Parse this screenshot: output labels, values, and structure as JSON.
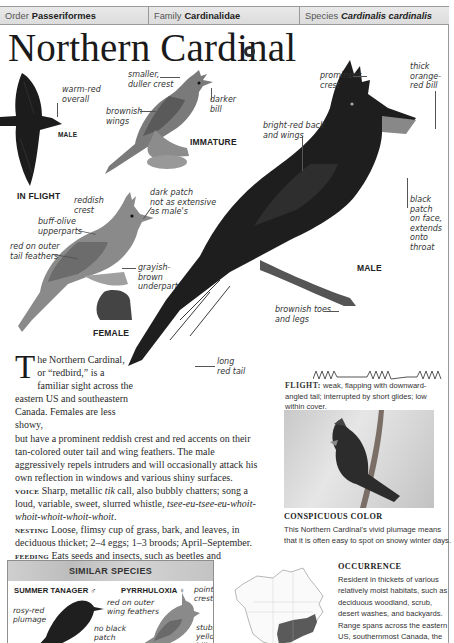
{
  "header": {
    "order": {
      "label": "Order",
      "value": "Passeriformes"
    },
    "family": {
      "label": "Family",
      "value": "Cardinalidae"
    },
    "species": {
      "label": "Species",
      "value": "Cardinalis cardinalis"
    }
  },
  "title": "Northern Cardinal",
  "icons": {
    "sound": "sound-icon"
  },
  "illustrations": {
    "in_flight": {
      "caption": "IN FLIGHT",
      "sex_label": "MALE",
      "annotations": [
        "warm-red\noverall"
      ]
    },
    "immature": {
      "caption": "IMMATURE",
      "annotations": [
        "smaller,\nduller crest",
        "darker\nbill",
        "brownish\nwings"
      ]
    },
    "female": {
      "caption": "FEMALE",
      "annotations": [
        "reddish\ncrest",
        "dark patch\nnot as extensive\nas male's",
        "buff-olive\nupperparts",
        "red on outer\ntail feathers",
        "grayish-\nbrown\nunderparts"
      ]
    },
    "male": {
      "caption": "MALE",
      "annotations": [
        "prominent\ncrest",
        "thick\norange-\nred bill",
        "bright-red back\nand wings",
        "black\npatch\non face,\nextends\nonto\nthroat",
        "brownish toes\nand legs",
        "long\nred tail"
      ]
    }
  },
  "description": {
    "dropcap": "T",
    "intro_narrow": [
      "he Northern Cardinal,",
      "or “redbird,” is a",
      "familiar sight across the",
      "eastern US and southeastern",
      "Canada. Females are less showy,"
    ],
    "intro_rest": "but have a prominent reddish crest and red accents on their tan-colored outer tail and wing feathers. The male aggressively repels intruders and will occasionally attack his own reflection in windows and various shiny surfaces.",
    "voice": {
      "label": "VOICE",
      "text_1": "Sharp, metallic ",
      "call": "tik",
      "text_2": " call, also bubbly chatters; song a loud, variable, sweet, slurred whistle, ",
      "song": "tsee-eu-tsee-eu-whoit-whoit-whoit-whoit-whoit",
      "text_3": "."
    },
    "nesting": {
      "label": "NESTING",
      "text": "Loose, flimsy cup of grass, bark, and leaves, in deciduous thicket; 2–4 eggs; 1–3 broods; April–September."
    },
    "feeding": {
      "label": "FEEDING",
      "text": "Eats seeds and insects, such as beetles and caterpillars; also buds and fruit."
    }
  },
  "flight": {
    "label": "FLIGHT:",
    "text": "weak, flapping with downward-angled tail; interrupted by short glides; low within cover."
  },
  "photo": {
    "title": "CONSPICUOUS COLOR",
    "caption": "This Northern Cardinal’s vivid plumage means that it is often easy to spot on snowy winter days."
  },
  "similar_species": {
    "title": "SIMILAR SPECIES",
    "species": [
      {
        "name": "SUMMER TANAGER ♂",
        "annotations": [
          "rosy-red\nplumage",
          "no black\npatch"
        ]
      },
      {
        "name": "PYRRHULOXIA ♀",
        "annotations": [
          "pointed\ncrest",
          "red on outer\nwing feathers",
          "stubby\nyellow\nbill"
        ]
      }
    ]
  },
  "occurrence": {
    "title": "OCCURRENCE",
    "text": "Resident in thickets of various relatively moist habitats, such as deciduous woodland, scrub, desert washes, and backyards. Range spans across the eastern US, southernmost Canada, the extreme Southwest, and"
  }
}
